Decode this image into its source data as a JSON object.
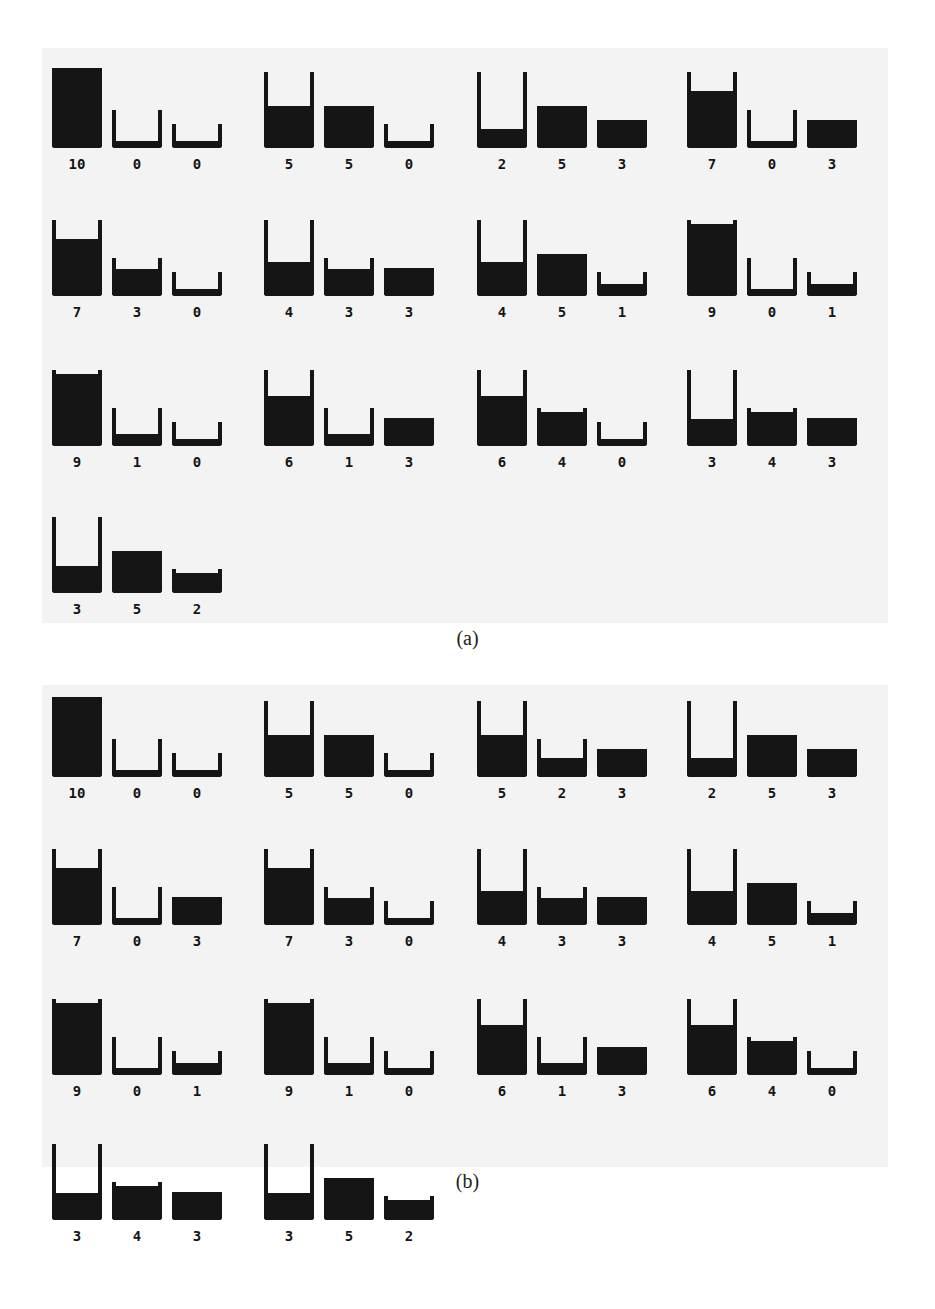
{
  "capacities": [
    10,
    5,
    3
  ],
  "colors": {
    "ink": "#151515",
    "panel_bg": "#f3f3f3",
    "page_bg": "#ffffff"
  },
  "panels": [
    {
      "caption": "(a)",
      "states": [
        [
          10,
          0,
          0
        ],
        [
          5,
          5,
          0
        ],
        [
          2,
          5,
          3
        ],
        [
          7,
          0,
          3
        ],
        [
          7,
          3,
          0
        ],
        [
          4,
          3,
          3
        ],
        [
          4,
          5,
          1
        ],
        [
          9,
          0,
          1
        ],
        [
          9,
          1,
          0
        ],
        [
          6,
          1,
          3
        ],
        [
          6,
          4,
          0
        ],
        [
          3,
          4,
          3
        ],
        [
          3,
          5,
          2
        ]
      ]
    },
    {
      "caption": "(b)",
      "states": [
        [
          10,
          0,
          0
        ],
        [
          5,
          5,
          0
        ],
        [
          5,
          2,
          3
        ],
        [
          2,
          5,
          3
        ],
        [
          7,
          0,
          3
        ],
        [
          7,
          3,
          0
        ],
        [
          4,
          3,
          3
        ],
        [
          4,
          5,
          1
        ],
        [
          9,
          0,
          1
        ],
        [
          9,
          1,
          0
        ],
        [
          6,
          1,
          3
        ],
        [
          6,
          4,
          0
        ],
        [
          3,
          4,
          3
        ],
        [
          3,
          5,
          2
        ]
      ]
    }
  ]
}
